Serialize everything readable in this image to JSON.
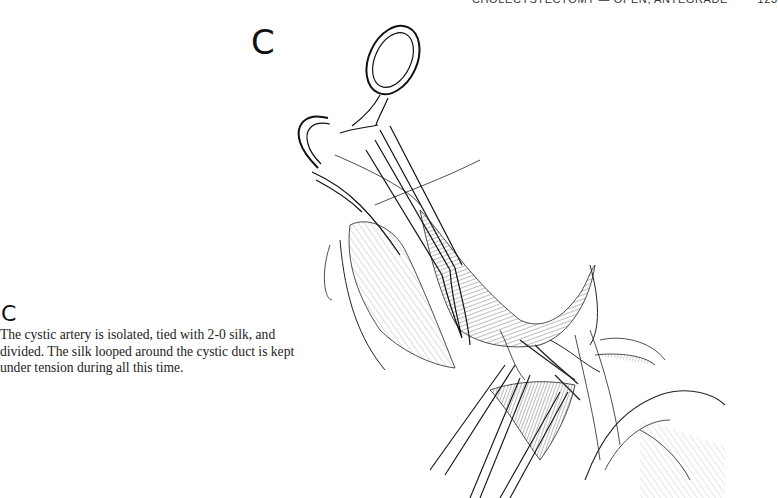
{
  "running_head": {
    "title": "CHOLECYSTECTOMY — OPEN, ANTEGRADE",
    "page_number": "123"
  },
  "figure": {
    "label": "C",
    "illustration": "hemostat-clamping-cystic-artery-drawing"
  },
  "caption": {
    "label": "C",
    "lines": [
      "The cystic artery is isolated, tied with 2-0 silk, and",
      "divided. The silk looped around the cystic duct is kept",
      "under tension during all this time."
    ]
  }
}
